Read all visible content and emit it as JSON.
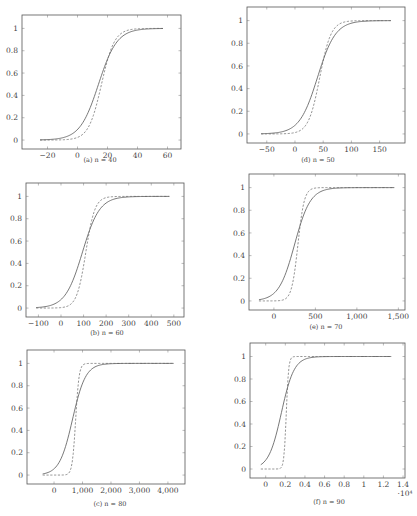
{
  "chart_data": [
    {
      "id": "a",
      "type": "line",
      "caption": "(a) n = 40",
      "frame": {
        "left": 22,
        "top": 15,
        "right": 181,
        "bottom": 149
      },
      "xlim": [
        -37,
        69
      ],
      "ylim": [
        -0.08,
        1.12
      ],
      "xticks": [
        -20,
        0,
        20,
        40,
        60
      ],
      "xtick_labels": [
        "−20",
        "0",
        "20",
        "40",
        "60"
      ],
      "yticks": [
        0,
        0.2,
        0.4,
        0.6,
        0.8,
        1
      ],
      "ytick_labels": [
        "0",
        "0.2",
        "0.4",
        "0.6",
        "0.8",
        "1"
      ],
      "x_exponent": "",
      "caption_pos": {
        "x": 100,
        "y": 160
      },
      "series": [
        {
          "name": "solid",
          "style": "solid",
          "x_range": [
            -25,
            57
          ],
          "mid": 14,
          "scale": 6.2
        },
        {
          "name": "dashed",
          "style": "dashed",
          "x_range": [
            -25,
            57
          ],
          "mid": 16,
          "scale": 4.3
        }
      ]
    },
    {
      "id": "d",
      "type": "line",
      "caption": "(d) n = 50",
      "frame": {
        "left": 247,
        "top": 7,
        "right": 405,
        "bottom": 143
      },
      "xlim": [
        -85,
        195
      ],
      "ylim": [
        -0.08,
        1.12
      ],
      "xticks": [
        -50,
        0,
        50,
        100,
        150
      ],
      "xtick_labels": [
        "−50",
        "0",
        "50",
        "100",
        "150"
      ],
      "yticks": [
        0,
        0.2,
        0.4,
        0.6,
        0.8,
        1
      ],
      "ytick_labels": [
        "0",
        "0.2",
        "0.4",
        "0.6",
        "0.8",
        "1"
      ],
      "x_exponent": "",
      "caption_pos": {
        "x": 318,
        "y": 160
      },
      "series": [
        {
          "name": "solid",
          "style": "solid",
          "x_range": [
            -60,
            170
          ],
          "mid": 40,
          "scale": 16
        },
        {
          "name": "dashed",
          "style": "dashed",
          "x_range": [
            -60,
            170
          ],
          "mid": 44,
          "scale": 10
        }
      ]
    },
    {
      "id": "b",
      "type": "line",
      "caption": "(b) n = 60",
      "frame": {
        "left": 26,
        "top": 183,
        "right": 184,
        "bottom": 317
      },
      "xlim": [
        -155,
        545
      ],
      "ylim": [
        -0.08,
        1.12
      ],
      "xticks": [
        -100,
        0,
        100,
        200,
        300,
        400,
        500
      ],
      "xtick_labels": [
        "−100",
        "0",
        "100",
        "200",
        "300",
        "400",
        "500"
      ],
      "yticks": [
        0,
        0.2,
        0.4,
        0.6,
        0.8,
        1
      ],
      "ytick_labels": [
        "0",
        "0.2",
        "0.4",
        "0.6",
        "0.8",
        "1"
      ],
      "x_exponent": "",
      "caption_pos": {
        "x": 107,
        "y": 333
      },
      "series": [
        {
          "name": "solid",
          "style": "solid",
          "x_range": [
            -110,
            480
          ],
          "mid": 95,
          "scale": 38
        },
        {
          "name": "dashed",
          "style": "dashed",
          "x_range": [
            -110,
            480
          ],
          "mid": 110,
          "scale": 20
        }
      ]
    },
    {
      "id": "e",
      "type": "line",
      "caption": "(e) n = 70",
      "frame": {
        "left": 249,
        "top": 174,
        "right": 405,
        "bottom": 310
      },
      "xlim": [
        -300,
        1580
      ],
      "ylim": [
        -0.08,
        1.12
      ],
      "xticks": [
        0,
        500,
        1000,
        1500
      ],
      "xtick_labels": [
        "0",
        "500",
        "1,000",
        "1,500"
      ],
      "yticks": [
        0,
        0.2,
        0.4,
        0.6,
        0.8,
        1
      ],
      "ytick_labels": [
        "0",
        "0.2",
        "0.4",
        "0.6",
        "0.8",
        "1"
      ],
      "x_exponent": "",
      "caption_pos": {
        "x": 326,
        "y": 327
      },
      "series": [
        {
          "name": "solid",
          "style": "solid",
          "x_range": [
            -180,
            1450
          ],
          "mid": 250,
          "scale": 95
        },
        {
          "name": "dashed",
          "style": "dashed",
          "x_range": [
            -180,
            1450
          ],
          "mid": 290,
          "scale": 38
        }
      ]
    },
    {
      "id": "c",
      "type": "line",
      "caption": "(c) n = 80",
      "frame": {
        "left": 27,
        "top": 350,
        "right": 185,
        "bottom": 484
      },
      "xlim": [
        -950,
        4600
      ],
      "ylim": [
        -0.08,
        1.12
      ],
      "xticks": [
        0,
        1000,
        2000,
        3000,
        4000
      ],
      "xtick_labels": [
        "0",
        "1,000",
        "2,000",
        "3,000",
        "4,000"
      ],
      "yticks": [
        0,
        0.2,
        0.4,
        0.6,
        0.8,
        1
      ],
      "ytick_labels": [
        "0",
        "0.2",
        "0.4",
        "0.6",
        "0.8",
        "1"
      ],
      "x_exponent": "",
      "caption_pos": {
        "x": 110,
        "y": 504
      },
      "series": [
        {
          "name": "solid",
          "style": "solid",
          "x_range": [
            -400,
            4200
          ],
          "mid": 650,
          "scale": 230
        },
        {
          "name": "dashed",
          "style": "dashed",
          "x_range": [
            -400,
            4200
          ],
          "mid": 760,
          "scale": 60
        }
      ]
    },
    {
      "id": "f",
      "type": "line",
      "caption": "(f) n = 90",
      "frame": {
        "left": 250,
        "top": 343,
        "right": 405,
        "bottom": 478
      },
      "xlim": [
        -1600,
        14200
      ],
      "ylim": [
        -0.08,
        1.12
      ],
      "xticks": [
        0,
        2000,
        4000,
        6000,
        8000,
        10000,
        12000,
        14000
      ],
      "xtick_labels": [
        "0",
        "0.2",
        "0.4",
        "0.6",
        "0.8",
        "1",
        "1.2",
        "1.4"
      ],
      "yticks": [
        0,
        0.2,
        0.4,
        0.6,
        0.8,
        1
      ],
      "ytick_labels": [
        "0",
        "0.2",
        "0.4",
        "0.6",
        "0.8",
        "1"
      ],
      "x_exponent": "·10⁴",
      "caption_pos": {
        "x": 329,
        "y": 502
      },
      "series": [
        {
          "name": "solid",
          "style": "solid",
          "x_range": [
            -500,
            12800
          ],
          "mid": 1600,
          "scale": 650
        },
        {
          "name": "dashed",
          "style": "dashed",
          "x_range": [
            -500,
            12800
          ],
          "mid": 2100,
          "scale": 120
        }
      ]
    }
  ]
}
